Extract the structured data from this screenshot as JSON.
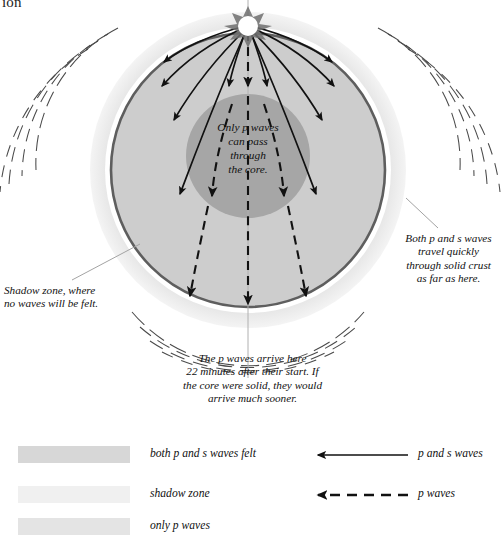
{
  "page": {
    "clipped_title": "ion",
    "background": "#ffffff"
  },
  "diagram": {
    "name": "earth-seismic-wave-cross-section",
    "source_label": "earthquake-focus",
    "annotations": {
      "core": "Only p waves\ncan pass\nthrough\nthe core.",
      "core_lines": [
        "Only p waves",
        "can pass",
        "through",
        "the core."
      ],
      "shadow": "Shadow zone, where\nno waves will be felt.",
      "shadow_lines": [
        "Shadow zone, where",
        "no waves will be felt."
      ],
      "crust": "Both p and s waves\ntravel quickly\nthrough solid crust\nas far as here.",
      "crust_lines": [
        "Both p and s waves",
        "travel quickly",
        "through solid crust",
        "as far as here."
      ],
      "arrival": "The p waves arrive here\n22 minutes after their start. If\nthe core were solid, they would\narrive much sooner.",
      "arrival_lines": [
        "The p waves arrive here",
        "22 minutes after their start. If",
        "the core were solid, they would",
        "arrive much sooner."
      ]
    },
    "colors": {
      "halo": "#e3e3e3",
      "gap": "#ffffff",
      "crust_line": "#5a5a5a",
      "mantle": "#cdcdcd",
      "core": "#a6a6a6",
      "ray": "#111111",
      "leader": "#9a9a9a"
    },
    "values": {
      "arrival_minutes": "22"
    }
  },
  "legend": {
    "zones": [
      {
        "label": "both p and s waves felt",
        "color": "#d7d7d7"
      },
      {
        "label": "shadow zone",
        "color": "#f0f0f0"
      },
      {
        "label": "only p waves",
        "color": "#e4e4e4"
      }
    ],
    "keys": [
      {
        "label": "p and s waves",
        "style": "solid"
      },
      {
        "label": "p waves",
        "style": "dashed"
      }
    ]
  }
}
